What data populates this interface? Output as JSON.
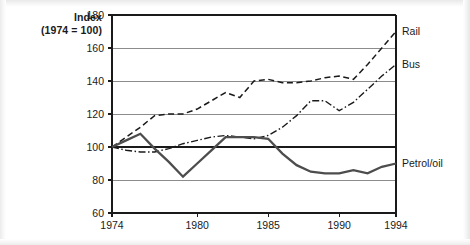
{
  "axis_title": {
    "line1": "Index",
    "line2": "(1974 = 100)"
  },
  "labels": {
    "rail": "Rail",
    "bus": "Bus",
    "petrol": "Petrol/oil"
  },
  "colors": {
    "axis": "#1a1a1a",
    "gridline": "#8c8c8c",
    "rail_line": "#1a1a1a",
    "bus_line": "#1a1a1a",
    "petrol_line": "#4d4d4d",
    "background": "#ffffff"
  },
  "chart_data": {
    "type": "line",
    "title": "Index (1974 = 100)",
    "xlabel": "",
    "ylabel": "Index (1974 = 100)",
    "xlim": [
      1974,
      1994
    ],
    "ylim": [
      60,
      180
    ],
    "yticks": [
      60,
      80,
      100,
      120,
      140,
      160,
      180
    ],
    "xticks": [
      1974,
      1980,
      1985,
      1990,
      1994
    ],
    "ytick_labels": [
      "60",
      "80",
      "100",
      "120",
      "140",
      "160",
      "180"
    ],
    "xtick_labels": [
      "1974",
      "1980",
      "1985",
      "1990",
      "1994"
    ],
    "grid": "horizontal",
    "legend": "inline-right-of-axis",
    "x": [
      1974,
      1975,
      1976,
      1977,
      1978,
      1979,
      1980,
      1981,
      1982,
      1983,
      1984,
      1985,
      1986,
      1987,
      1988,
      1989,
      1990,
      1991,
      1992,
      1993,
      1994
    ],
    "series": [
      {
        "name": "Rail",
        "style": "dashed",
        "values": [
          100,
          106,
          112,
          119,
          120,
          120,
          123,
          128,
          133,
          130,
          140,
          141,
          139,
          139,
          140,
          142,
          143,
          141,
          150,
          160,
          170
        ]
      },
      {
        "name": "Bus",
        "style": "dash-dot",
        "values": [
          100,
          98,
          97,
          97,
          99,
          102,
          104,
          106,
          107,
          106,
          105,
          107,
          112,
          119,
          128,
          128,
          122,
          127,
          135,
          143,
          150
        ]
      },
      {
        "name": "Petrol/oil",
        "style": "solid-thick",
        "values": [
          100,
          104,
          108,
          99,
          91,
          82,
          90,
          98,
          106,
          106,
          106,
          105,
          96,
          89,
          85,
          84,
          84,
          86,
          84,
          88,
          90
        ]
      }
    ]
  }
}
